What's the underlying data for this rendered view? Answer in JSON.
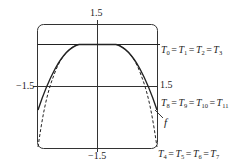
{
  "diagram": {
    "type": "function-approximation-plot",
    "colors": {
      "curve": "#222222",
      "frame": "#333333",
      "background": "#ffffff"
    },
    "axes": {
      "x_min_label": "-1.5",
      "x_max_label": "1.5",
      "y_max_label": "1.5",
      "y_min_label": "-1.5"
    },
    "labels": {
      "top": "1.5",
      "left": "−1.5",
      "right": "1.5",
      "bottom": "−1.5",
      "function": "f"
    },
    "equations": [
      {
        "id": "group-0",
        "terms": [
          "T",
          "0",
          "T",
          "1",
          "T",
          "2",
          "T",
          "3"
        ],
        "text": "T0 = T1 = T2 = T3",
        "style": "solid horizontal line"
      },
      {
        "id": "group-8",
        "terms": [
          "T",
          "8",
          "T",
          "9",
          "T",
          "10",
          "T",
          "11"
        ],
        "text": "T8 = T9 = T10 = T11",
        "style": "solid curve (nearly coincides with f)"
      },
      {
        "id": "group-4",
        "terms": [
          "T",
          "4",
          "T",
          "5",
          "T",
          "6",
          "T",
          "7"
        ],
        "text": "T4 = T5 = T6 = T7",
        "style": "dashed curve"
      }
    ],
    "equals_sign": "="
  }
}
